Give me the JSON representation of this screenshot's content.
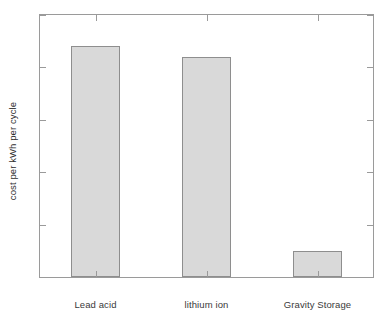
{
  "chart_data": {
    "type": "bar",
    "title": "",
    "xlabel": "",
    "ylabel": "cost per kWh per cycle",
    "categories": [
      "Lead acid",
      "lithium ion",
      "Gravity Storage"
    ],
    "values": [
      2.2,
      2.1,
      0.25
    ],
    "ylim": [
      0,
      2.5
    ],
    "yticks": [
      0,
      0.5,
      1,
      1.5,
      2,
      2.5
    ],
    "ytick_labels": [
      "0",
      "0.5",
      "1",
      "1.5",
      "2",
      "2.5"
    ],
    "grid": false,
    "legend": null,
    "bar_face_color": "#d9d9d9",
    "bar_edge_color": "#8e8e8e",
    "axis_color": "#9a9a9a",
    "text_color": "#3a3a3a",
    "background": "#ffffff"
  },
  "axes": {
    "ylabel": "cost per kWh per cycle"
  }
}
